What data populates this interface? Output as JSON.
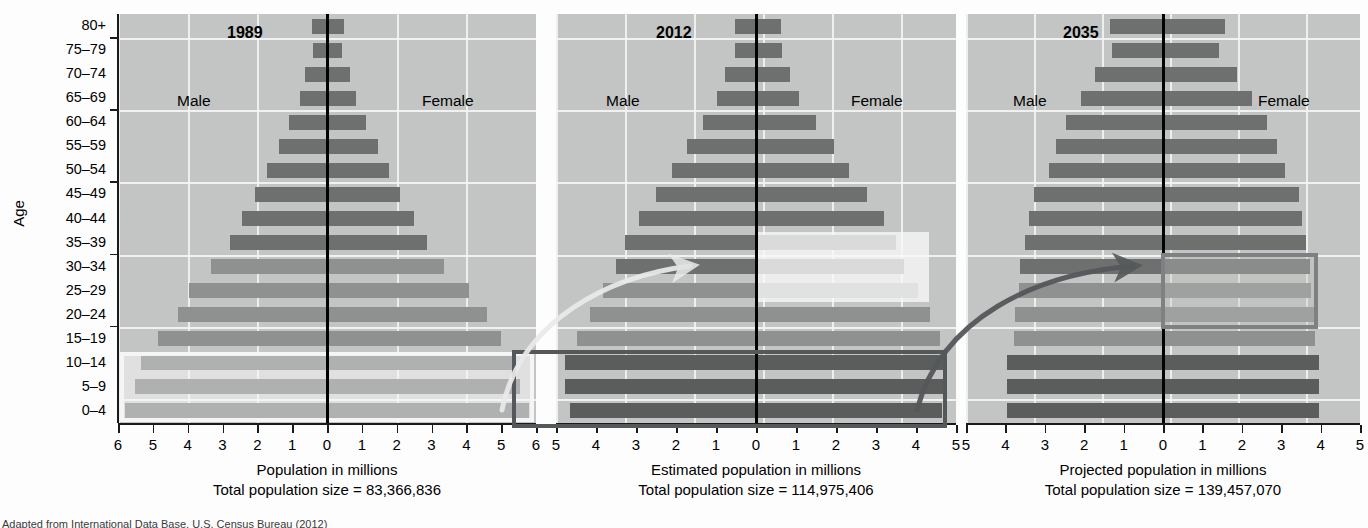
{
  "axis": {
    "y_title": "Age",
    "age_groups": [
      "80+",
      "75–79",
      "70–74",
      "65–69",
      "60–64",
      "55–59",
      "50–54",
      "45–49",
      "40–44",
      "35–39",
      "30–34",
      "25–29",
      "20–24",
      "15–19",
      "10–14",
      "5–9",
      "0–4"
    ]
  },
  "panels": [
    {
      "id": "panel-1989",
      "title": "1989",
      "male_label": "Male",
      "female_label": "Female",
      "axis_title": "Population in millions",
      "total_line": "Total population size = 83,366,836",
      "x_ticks": [
        "6",
        "5",
        "4",
        "3",
        "2",
        "1",
        "0",
        "1",
        "2",
        "3",
        "4",
        "5",
        "6"
      ],
      "x_max": 6
    },
    {
      "id": "panel-2012",
      "title": "2012",
      "male_label": "Male",
      "female_label": "Female",
      "axis_title": "Estimated population in millions",
      "total_line": "Total population size = 114,975,406",
      "x_ticks": [
        "5",
        "4",
        "3",
        "2",
        "1",
        "0",
        "1",
        "2",
        "3",
        "4",
        "5"
      ],
      "x_max": 5.8
    },
    {
      "id": "panel-2035",
      "title": "2035",
      "male_label": "Male",
      "female_label": "Female",
      "axis_title": "Projected population in millions",
      "total_line": "Total population size = 139,457,070",
      "x_ticks": [
        "5",
        "4",
        "3",
        "2",
        "1",
        "0",
        "1",
        "2",
        "3",
        "4",
        "5"
      ],
      "x_max": 5.8
    }
  ],
  "source_note": "Adapted from International Data Base, U.S. Census Bureau (2012)",
  "colors": {
    "plot_background": "#c3c5c4",
    "bar_mid": "#8e9190",
    "bar_dark": "#6d706f",
    "bar_very_dark": "#5a5d5c",
    "gridline": "#f2f3f2",
    "center_axis": "#000000",
    "highlight_dark_border": "#55585a",
    "highlight_grey_border": "#7d8183"
  },
  "chart_data": {
    "type": "bar",
    "xlabel": "Population in millions",
    "ylabel": "Age",
    "grid": true,
    "legend": [
      "Male",
      "Female"
    ],
    "categories": [
      "80+",
      "75–79",
      "70–74",
      "65–69",
      "60–64",
      "55–59",
      "50–54",
      "45–49",
      "40–44",
      "35–39",
      "30–34",
      "25–29",
      "20–24",
      "15–19",
      "10–14",
      "5–9",
      "0–4"
    ],
    "panels": [
      {
        "name": "1989",
        "total_population": 83366836,
        "xlim": [
          -6,
          6
        ],
        "series": [
          {
            "name": "Male",
            "values": [
              0.42,
              0.4,
              0.62,
              0.78,
              1.08,
              1.38,
              1.72,
              2.08,
              2.45,
              2.78,
              3.32,
              3.95,
              4.28,
              4.85,
              5.35,
              5.5,
              5.8
            ]
          },
          {
            "name": "Female",
            "values": [
              0.48,
              0.42,
              0.65,
              0.82,
              1.12,
              1.45,
              1.78,
              2.1,
              2.5,
              2.88,
              3.35,
              4.08,
              4.6,
              5.0,
              5.4,
              5.55,
              5.8
            ]
          }
        ]
      },
      {
        "name": "2012",
        "total_population": 114975406,
        "xlim": [
          -5.8,
          5.8
        ],
        "series": [
          {
            "name": "Male",
            "values": [
              0.6,
              0.62,
              0.9,
              1.12,
              1.55,
              2.0,
              2.45,
              2.9,
              3.4,
              3.8,
              4.05,
              4.45,
              4.8,
              5.2,
              5.55,
              5.55,
              5.4
            ]
          },
          {
            "name": "Female",
            "values": [
              0.72,
              0.75,
              1.0,
              1.25,
              1.75,
              2.25,
              2.7,
              3.22,
              3.7,
              4.05,
              4.3,
              4.7,
              5.05,
              5.35,
              5.55,
              5.55,
              5.4
            ]
          }
        ]
      },
      {
        "name": "2035",
        "total_population": 139457070,
        "xlim": [
          -5.8,
          5.8
        ],
        "series": [
          {
            "name": "Male",
            "values": [
              1.55,
              1.5,
              2.0,
              2.42,
              2.85,
              3.15,
              3.35,
              3.8,
              3.95,
              4.05,
              4.22,
              4.25,
              4.35,
              4.4,
              4.6,
              4.6,
              4.6
            ]
          },
          {
            "name": "Female",
            "values": [
              1.82,
              1.65,
              2.18,
              2.62,
              3.05,
              3.35,
              3.6,
              4.0,
              4.1,
              4.2,
              4.32,
              4.35,
              4.45,
              4.48,
              4.6,
              4.6,
              4.6
            ]
          }
        ]
      }
    ],
    "annotations": [
      {
        "type": "highlight-box",
        "panel": "1989",
        "age_range": [
          "10–14",
          "5–9",
          "0–4"
        ],
        "style": "light-outline"
      },
      {
        "type": "highlight-box",
        "panel": "2012",
        "age_range": [
          "35–39",
          "30–34",
          "25–29"
        ],
        "style": "light-fill"
      },
      {
        "type": "highlight-box",
        "panel": "2012",
        "age_range": [
          "10–14",
          "5–9",
          "0–4"
        ],
        "style": "dark-outline"
      },
      {
        "type": "highlight-box",
        "panel": "2035",
        "age_range": [
          "30–34",
          "25–29",
          "20–24"
        ],
        "style": "dark-outline"
      },
      {
        "type": "arrow",
        "from": "1989 cohort 0–14",
        "to": "2012 cohort 25–39",
        "style": "light"
      },
      {
        "type": "arrow",
        "from": "2012 cohort 0–14",
        "to": "2035 cohort 20–34",
        "style": "dark"
      }
    ]
  }
}
